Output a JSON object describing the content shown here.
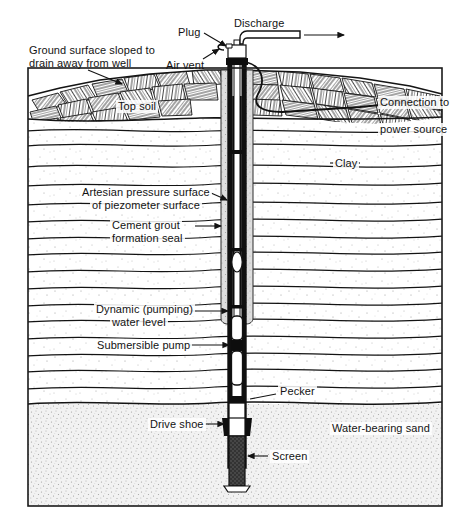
{
  "figure": {
    "frame_color": "#1a1a1a",
    "background": "#ffffff"
  },
  "labels": {
    "ground_surface": "Ground surface sloped to\ndrain away from well",
    "ground_surface_line1": "Ground surface sloped to",
    "ground_surface_line2": "drain away from well",
    "plug": "Plug",
    "air_vent": "Air vent",
    "discharge": "Discharge",
    "top_soil": "Top soil",
    "connection_line1": "Connection to",
    "connection_line2": "power source",
    "clay": "Clay",
    "artesian_line1": "Artesian pressure surface",
    "artesian_line2": "of piezometer surface",
    "cement_line1": "Cement grout",
    "cement_line2": "formation seal",
    "dynamic_line1": "Dynamic (pumping)",
    "dynamic_line2": "water level",
    "submersible_pump": "Submersible pump",
    "pecker": "Pecker",
    "drive_shoe": "Drive shoe",
    "screen": "Screen",
    "water_bearing_sand": "Water-bearing sand"
  },
  "strata": {
    "topsoil": {
      "name": "Top soil",
      "pattern": "crosshatched-rubble",
      "color": "#ffffff",
      "stroke": "#141414"
    },
    "clay": {
      "name": "Clay",
      "pattern": "wavy-bedding-lines-with-stipple",
      "color": "#fdfdfd",
      "stroke": "#131313"
    },
    "sand": {
      "name": "Water-bearing sand",
      "pattern": "dense-stipple",
      "color": "#efefef",
      "stroke": "#141414"
    }
  },
  "components": {
    "outer_casing": "outer well casing",
    "inner_drop_pipe": "inner drop pipe",
    "discharge_pipe": "discharge pipe",
    "vent_pipe": "air vent pipe",
    "cement_grout": "cement grout formation seal",
    "pump": "submersible pump body",
    "pecker": "pecker",
    "drive_shoe": "drive shoe",
    "screen": "well screen",
    "power_cable": "power cable to source"
  },
  "colors": {
    "ink": "#131313",
    "casing_dark": "#101010",
    "grout_grey": "#dcdcdc",
    "sand_grey": "#ebebeb",
    "screen_dark": "#3a3a3a"
  }
}
